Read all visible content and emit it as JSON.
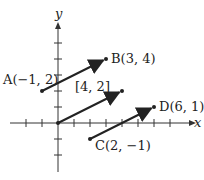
{
  "axes": {
    "x_label": "x",
    "y_label": "y"
  },
  "points": {
    "A": {
      "label": "A(−1, 2)",
      "name": "A",
      "coords": "(−1, 2)"
    },
    "B": {
      "label": "B(3, 4)",
      "name": "B",
      "coords": "(3, 4)"
    },
    "C": {
      "label": "C(2, −1)",
      "name": "C",
      "coords": "(2, −1)"
    },
    "D": {
      "label": "D(6, 1)",
      "name": "D",
      "coords": "(6, 1)"
    }
  },
  "vector_label": "[4, 2]",
  "colors": {
    "ink": "#222222"
  }
}
